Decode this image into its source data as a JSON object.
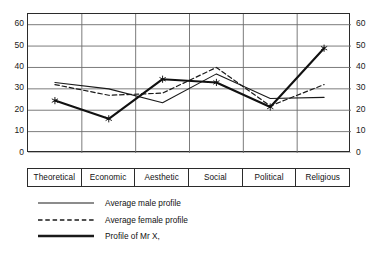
{
  "chart_data": {
    "type": "line",
    "title": "",
    "xlabel": "",
    "ylabel": "",
    "ylim": [
      0,
      65
    ],
    "yticks": [
      0,
      10,
      20,
      30,
      40,
      50,
      60
    ],
    "grid": true,
    "legend_position": "below",
    "dual_axis": true,
    "categories": [
      "Theoretical",
      "Economic",
      "Aesthetic",
      "Social",
      "Political",
      "Religious"
    ],
    "series": [
      {
        "name": "Average male profile",
        "style": "solid-thin",
        "marker": "none",
        "color": "#1a1a1a",
        "values": [
          33,
          30,
          23.5,
          37,
          25.5,
          26
        ]
      },
      {
        "name": "Average female profile",
        "style": "dashed",
        "marker": "none",
        "color": "#1a1a1a",
        "values": [
          32,
          27,
          28,
          40,
          22,
          32
        ]
      },
      {
        "name": "Profile of Mr X,",
        "style": "solid-thick",
        "marker": "star",
        "color": "#111111",
        "values": [
          24.5,
          16,
          34.5,
          33,
          21.5,
          49
        ]
      }
    ]
  },
  "axis": {
    "left_ticks": [
      "60",
      "50",
      "40",
      "30",
      "20",
      "10",
      "0"
    ],
    "right_ticks": [
      "60",
      "50",
      "40",
      "30",
      "20",
      "10",
      "0"
    ]
  },
  "categories": {
    "items": [
      {
        "label": "Theoretical"
      },
      {
        "label": "Economic"
      },
      {
        "label": "Aesthetic"
      },
      {
        "label": "Social"
      },
      {
        "label": "Political"
      },
      {
        "label": "Religious"
      }
    ]
  },
  "legend": {
    "items": [
      {
        "label": "Average male profile",
        "style": "solid-thin"
      },
      {
        "label": "Average  female profile",
        "style": "dashed"
      },
      {
        "label": "Profile of Mr X,",
        "style": "solid-thick"
      }
    ]
  },
  "colors": {
    "ink": "#1a1a1a",
    "grid": "#6d6d6d",
    "background": "#ffffff"
  }
}
